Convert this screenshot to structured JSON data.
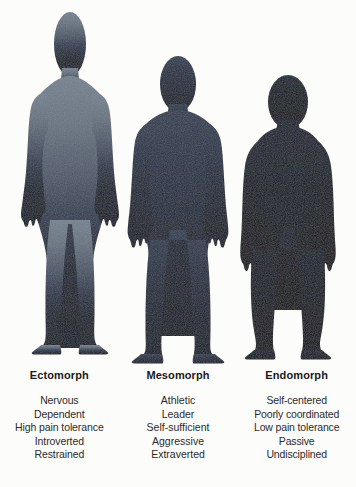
{
  "page": {
    "background_color": "#fcfcfa"
  },
  "figures": [
    {
      "id": "ectomorph",
      "name": "ectomorph-silhouette",
      "body_type": "ectomorph",
      "build": "tall, thin, narrow shoulders and hips, long limbs",
      "fill_top": "#6a7887",
      "fill_mid": "#3a4658",
      "fill_bottom": "#111a2a"
    },
    {
      "id": "mesomorph",
      "name": "mesomorph-silhouette",
      "body_type": "mesomorph",
      "build": "muscular, broad shoulders, athletic V-taper",
      "fill_top": "#2a3446",
      "fill_mid": "#1a2436",
      "fill_bottom": "#0e1726"
    },
    {
      "id": "endomorph",
      "name": "endomorph-silhouette",
      "body_type": "endomorph",
      "build": "rounded, wide waist and hips, short thick limbs",
      "fill_top": "#131c2c",
      "fill_mid": "#0c1420",
      "fill_bottom": "#080e18"
    }
  ],
  "columns": [
    {
      "label": "Ectomorph",
      "traits": [
        "Nervous",
        "Dependent",
        "High pain tolerance",
        "Introverted",
        "Restrained"
      ]
    },
    {
      "label": "Mesomorph",
      "traits": [
        "Athletic",
        "Leader",
        "Self-sufficient",
        "Aggressive",
        "Extraverted"
      ]
    },
    {
      "label": "Endomorph",
      "traits": [
        "Self-centered",
        "Poorly coordinated",
        "Low pain tolerance",
        "Passive",
        "Undisciplined"
      ]
    }
  ]
}
